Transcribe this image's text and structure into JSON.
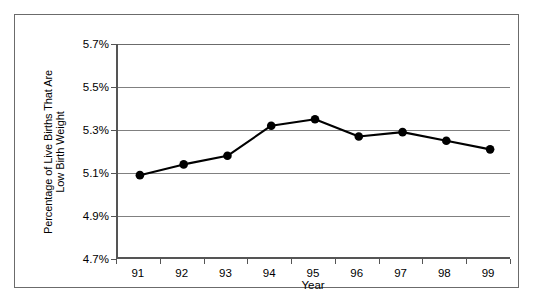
{
  "chart_data": {
    "type": "line",
    "title": "",
    "xlabel": "Year",
    "ylabel_lines": [
      "Percentage of Live Births That Are",
      "Low Birth Weight"
    ],
    "categories": [
      "91",
      "92",
      "93",
      "94",
      "95",
      "96",
      "97",
      "98",
      "99"
    ],
    "values": [
      5.09,
      5.14,
      5.18,
      5.32,
      5.35,
      5.27,
      5.29,
      5.25,
      5.21
    ],
    "series": [
      {
        "name": "Percentage of Live Births That Are Low Birth Weight",
        "values": [
          5.09,
          5.14,
          5.18,
          5.32,
          5.35,
          5.27,
          5.29,
          5.25,
          5.21
        ]
      }
    ],
    "ylim": [
      4.7,
      5.7
    ],
    "ytick_values": [
      5.7,
      5.5,
      5.3,
      5.1,
      4.9,
      4.7
    ],
    "ytick_labels": [
      "5.7%",
      "5.5%",
      "5.3%",
      "5.1%",
      "4.9%",
      "4.7%"
    ],
    "grid": true,
    "legend": false,
    "legend_position": "none",
    "marker": "circle",
    "marker_color": "#000000",
    "line_color": "#000000",
    "gridline_color": "#808080",
    "axis_color": "#555555",
    "frame_color": "#6b6b6b",
    "background_color": "#ffffff"
  }
}
